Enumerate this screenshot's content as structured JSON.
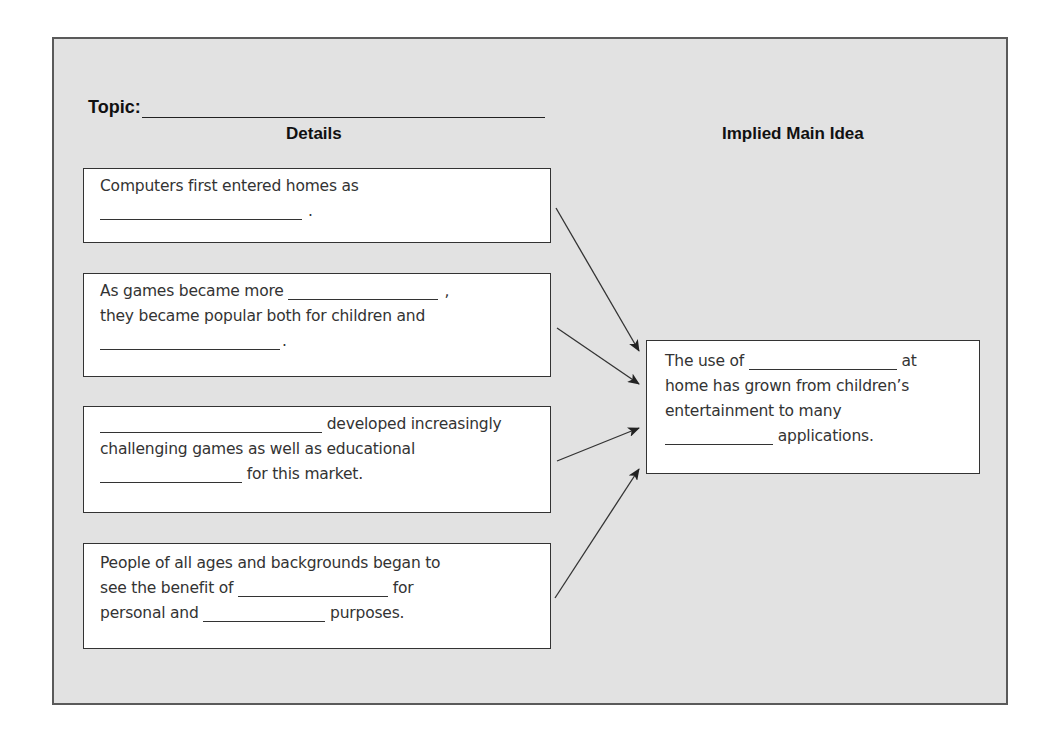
{
  "worksheet": {
    "topic_label": "Topic:",
    "columns": {
      "details": "Details",
      "main_idea": "Implied Main Idea"
    },
    "details": [
      {
        "lines": [
          [
            "Computers first entered homes as"
          ],
          [
            "",
            "."
          ]
        ]
      },
      {
        "lines": [
          [
            "As games became more ",
            ","
          ],
          [
            "they became popular both for children and"
          ],
          [
            "",
            "."
          ]
        ]
      },
      {
        "lines": [
          [
            "",
            " developed increasingly"
          ],
          [
            "challenging games as well as educational"
          ],
          [
            "",
            " for this market."
          ]
        ]
      },
      {
        "lines": [
          [
            "People of all ages and backgrounds began to"
          ],
          [
            "see the benefit of ",
            " for"
          ],
          [
            "personal and ",
            " purposes."
          ]
        ]
      }
    ],
    "main_idea": {
      "lines": [
        [
          "The use of ",
          " at"
        ],
        [
          "home has grown from children’s"
        ],
        [
          "entertainment to many"
        ],
        [
          "",
          " applications."
        ]
      ]
    },
    "arrows": [
      {
        "from": [
          556,
          208
        ],
        "to": [
          639,
          351
        ]
      },
      {
        "from": [
          557,
          328
        ],
        "to": [
          639,
          384
        ]
      },
      {
        "from": [
          557,
          461
        ],
        "to": [
          639,
          428
        ]
      },
      {
        "from": [
          555,
          598
        ],
        "to": [
          639,
          469
        ]
      }
    ]
  }
}
